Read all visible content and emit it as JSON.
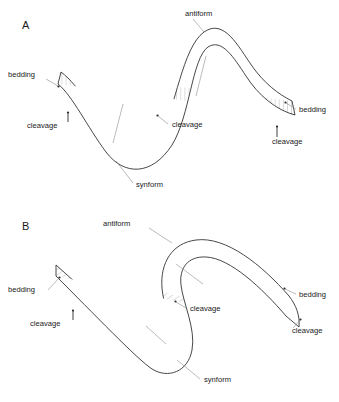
{
  "figure": {
    "background_color": "#ffffff",
    "outline_color": "#33332f",
    "hatch_color": "#8d8d8d",
    "leader_color": "#8d8d8d",
    "text_color": "#1a1a1a"
  },
  "panels": [
    {
      "id": "A",
      "letter": "A",
      "fold_style": "open-upright-sinusoidal",
      "cleavage_orientation": "vertical",
      "labels": {
        "antiform": "antiform",
        "synform": "synform",
        "bedding_left": "bedding",
        "bedding_right": "bedding",
        "cleavage_left": "cleavage",
        "cleavage_middle": "cleavage",
        "cleavage_right": "cleavage"
      }
    },
    {
      "id": "B",
      "letter": "B",
      "fold_style": "tight-inclined-s-fold",
      "cleavage_orientation": "inclined",
      "labels": {
        "antiform": "antiform",
        "synform": "synform",
        "bedding_left": "bedding",
        "bedding_right": "bedding",
        "cleavage_left": "cleavage",
        "cleavage_middle": "cleavage",
        "cleavage_right": "cleavage"
      }
    }
  ]
}
